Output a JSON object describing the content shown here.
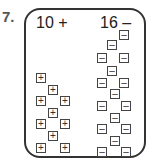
{
  "problem_number": "7.",
  "left": {
    "label": "10 +",
    "tile_symbol": "+",
    "count": 10,
    "tiles": [
      [
        36,
        73
      ],
      [
        48,
        85
      ],
      [
        36,
        96
      ],
      [
        60,
        96
      ],
      [
        48,
        108
      ],
      [
        36,
        119
      ],
      [
        60,
        119
      ],
      [
        48,
        131
      ],
      [
        36,
        143
      ],
      [
        60,
        143
      ]
    ]
  },
  "right": {
    "label": "16 –",
    "tile_symbol": "–",
    "count": 16,
    "tiles": [
      [
        119,
        30
      ],
      [
        107,
        40
      ],
      [
        97,
        53
      ],
      [
        119,
        53
      ],
      [
        107,
        66
      ],
      [
        97,
        78
      ],
      [
        119,
        78
      ],
      [
        110,
        89
      ],
      [
        97,
        101
      ],
      [
        121,
        101
      ],
      [
        110,
        113
      ],
      [
        97,
        124
      ],
      [
        121,
        124
      ],
      [
        110,
        136
      ],
      [
        97,
        147
      ],
      [
        121,
        147
      ]
    ]
  }
}
